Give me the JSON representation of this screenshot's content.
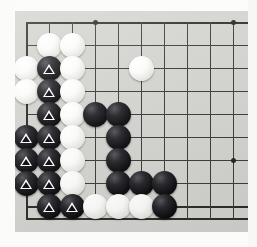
{
  "board": {
    "title": "Go board position",
    "kind": "go-board",
    "background_color": "#d2d2ce",
    "line_color": "#3a3a38",
    "black_stone_color": "#0a0a0c",
    "white_stone_color": "#fbfbfa",
    "marker_color": "#ffffff",
    "marker_shape": "triangle",
    "grid": {
      "origin_x": 26,
      "origin_y": 22,
      "spacing": 23,
      "columns_visible": 10,
      "rows_visible": 9,
      "left_edge_is_board_edge": true,
      "top_edge_is_board_edge": true,
      "bottom_edge_is_board_edge": true
    },
    "star_points": [
      {
        "col": 3,
        "row": 0
      },
      {
        "col": 9,
        "row": 0
      },
      {
        "col": 9,
        "row": 6
      }
    ],
    "stones": [
      {
        "col": 1,
        "row": 1,
        "color": "white",
        "marked": false
      },
      {
        "col": 2,
        "row": 1,
        "color": "white",
        "marked": false
      },
      {
        "col": 0,
        "row": 2,
        "color": "white",
        "marked": false
      },
      {
        "col": 1,
        "row": 2,
        "color": "black",
        "marked": true
      },
      {
        "col": 2,
        "row": 2,
        "color": "white",
        "marked": false
      },
      {
        "col": 5,
        "row": 2,
        "color": "white",
        "marked": false
      },
      {
        "col": 0,
        "row": 3,
        "color": "white",
        "marked": false
      },
      {
        "col": 1,
        "row": 3,
        "color": "black",
        "marked": true
      },
      {
        "col": 2,
        "row": 3,
        "color": "white",
        "marked": false
      },
      {
        "col": 1,
        "row": 4,
        "color": "black",
        "marked": true
      },
      {
        "col": 2,
        "row": 4,
        "color": "white",
        "marked": false
      },
      {
        "col": 3,
        "row": 4,
        "color": "black",
        "marked": false
      },
      {
        "col": 4,
        "row": 4,
        "color": "black",
        "marked": false
      },
      {
        "col": 0,
        "row": 5,
        "color": "black",
        "marked": true
      },
      {
        "col": 1,
        "row": 5,
        "color": "black",
        "marked": true
      },
      {
        "col": 2,
        "row": 5,
        "color": "white",
        "marked": false
      },
      {
        "col": 4,
        "row": 5,
        "color": "black",
        "marked": false
      },
      {
        "col": 0,
        "row": 6,
        "color": "black",
        "marked": true
      },
      {
        "col": 1,
        "row": 6,
        "color": "black",
        "marked": true
      },
      {
        "col": 2,
        "row": 6,
        "color": "white",
        "marked": false
      },
      {
        "col": 4,
        "row": 6,
        "color": "black",
        "marked": false
      },
      {
        "col": 0,
        "row": 7,
        "color": "black",
        "marked": true
      },
      {
        "col": 1,
        "row": 7,
        "color": "black",
        "marked": true
      },
      {
        "col": 2,
        "row": 7,
        "color": "white",
        "marked": false
      },
      {
        "col": 4,
        "row": 7,
        "color": "black",
        "marked": false
      },
      {
        "col": 5,
        "row": 7,
        "color": "black",
        "marked": false
      },
      {
        "col": 6,
        "row": 7,
        "color": "black",
        "marked": false
      },
      {
        "col": 1,
        "row": 8,
        "color": "black",
        "marked": true
      },
      {
        "col": 2,
        "row": 8,
        "color": "black",
        "marked": true
      },
      {
        "col": 3,
        "row": 8,
        "color": "white",
        "marked": false
      },
      {
        "col": 4,
        "row": 8,
        "color": "white",
        "marked": false
      },
      {
        "col": 5,
        "row": 8,
        "color": "white",
        "marked": false
      },
      {
        "col": 6,
        "row": 8,
        "color": "black",
        "marked": false
      }
    ]
  }
}
